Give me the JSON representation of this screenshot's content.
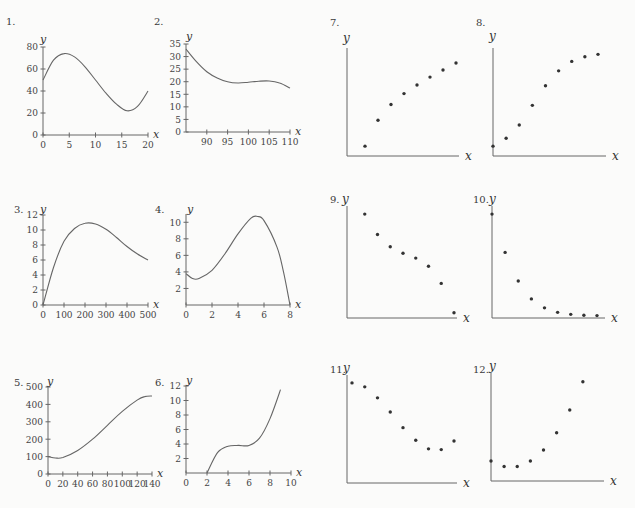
{
  "chart_data": [
    {
      "id": 1,
      "label": "1.",
      "type": "line",
      "xlabel": "x",
      "ylabel": "y",
      "xlim": [
        0,
        20
      ],
      "ylim": [
        0,
        80
      ],
      "xticks": [
        0,
        5,
        10,
        15,
        20
      ],
      "yticks": [
        0,
        20,
        40,
        60,
        80
      ],
      "x": [
        0,
        2,
        4,
        6,
        8,
        10,
        12,
        14,
        16,
        18,
        20
      ],
      "y": [
        50,
        68,
        74,
        71,
        62,
        50,
        38,
        28,
        22,
        26,
        40
      ]
    },
    {
      "id": 2,
      "label": "2.",
      "type": "line",
      "xlabel": "x",
      "ylabel": "y",
      "xlim": [
        85,
        110
      ],
      "ylim": [
        0,
        35
      ],
      "xticks": [
        90,
        95,
        100,
        105,
        110
      ],
      "yticks": [
        0,
        5,
        10,
        15,
        20,
        25,
        30,
        35
      ],
      "x": [
        85,
        87.5,
        90,
        92.5,
        95,
        97.5,
        100,
        102.5,
        105,
        107.5,
        110
      ],
      "y": [
        33,
        28,
        24,
        21.5,
        20,
        19.5,
        19.8,
        20.2,
        20.3,
        19.5,
        17.5
      ]
    },
    {
      "id": 3,
      "label": "3.",
      "type": "line",
      "xlabel": "x",
      "ylabel": "y",
      "xlim": [
        0,
        500
      ],
      "ylim": [
        0,
        12
      ],
      "xticks": [
        0,
        100,
        200,
        300,
        400,
        500
      ],
      "yticks": [
        0,
        2,
        4,
        6,
        8,
        10,
        12
      ],
      "x": [
        0,
        50,
        100,
        150,
        200,
        250,
        300,
        350,
        400,
        450,
        500
      ],
      "y": [
        0,
        5,
        8.5,
        10.2,
        10.9,
        10.8,
        10.1,
        9,
        7.8,
        6.8,
        6
      ]
    },
    {
      "id": 4,
      "label": "4.",
      "type": "line",
      "xlabel": "x",
      "ylabel": "y",
      "xlim": [
        0,
        8
      ],
      "ylim": [
        0,
        11
      ],
      "xticks": [
        0,
        2,
        4,
        6,
        8
      ],
      "yticks": [
        2,
        4,
        6,
        8,
        10
      ],
      "x": [
        0,
        0.5,
        1,
        2,
        3,
        4,
        5,
        5.5,
        6,
        7,
        7.5,
        8
      ],
      "y": [
        3.8,
        3.2,
        3.2,
        4.2,
        6.2,
        8.6,
        10.5,
        10.7,
        10.2,
        7,
        4,
        0
      ]
    },
    {
      "id": 5,
      "label": "5.",
      "type": "line",
      "xlabel": "x",
      "ylabel": "y",
      "xlim": [
        0,
        140
      ],
      "ylim": [
        0,
        500
      ],
      "xticks": [
        0,
        20,
        40,
        60,
        80,
        100,
        120,
        140
      ],
      "yticks": [
        0,
        100,
        200,
        300,
        400,
        500
      ],
      "x": [
        0,
        10,
        20,
        40,
        60,
        80,
        100,
        120,
        130,
        140
      ],
      "y": [
        100,
        92,
        95,
        135,
        200,
        280,
        360,
        425,
        445,
        448
      ]
    },
    {
      "id": 6,
      "label": "6.",
      "type": "line",
      "xlabel": "x",
      "ylabel": "y",
      "xlim": [
        0,
        10
      ],
      "ylim": [
        0,
        12
      ],
      "xticks": [
        0,
        2,
        4,
        6,
        8,
        10
      ],
      "yticks": [
        2,
        4,
        6,
        8,
        10,
        12
      ],
      "x": [
        2,
        3,
        4,
        5,
        6,
        7,
        8,
        9
      ],
      "y": [
        0,
        2.8,
        3.7,
        3.8,
        3.8,
        4.8,
        7.5,
        11.5
      ]
    },
    {
      "id": 7,
      "label": "7.",
      "type": "scatter",
      "xlabel": "x",
      "ylabel": "y",
      "points": [
        [
          1,
          1.0
        ],
        [
          2,
          4.3
        ],
        [
          3,
          6.3
        ],
        [
          4,
          7.7
        ],
        [
          5,
          8.8
        ],
        [
          6,
          9.8
        ],
        [
          7,
          10.7
        ],
        [
          8,
          11.6
        ]
      ]
    },
    {
      "id": 8,
      "label": "8.",
      "type": "scatter",
      "xlabel": "x",
      "ylabel": "y",
      "points": [
        [
          0,
          1.0
        ],
        [
          1,
          2.0
        ],
        [
          2,
          3.7
        ],
        [
          3,
          6.2
        ],
        [
          4,
          8.7
        ],
        [
          5,
          10.6
        ],
        [
          6,
          11.8
        ],
        [
          7,
          12.4
        ],
        [
          8,
          12.7
        ]
      ]
    },
    {
      "id": 9,
      "label": "9.",
      "type": "scatter",
      "xlabel": "x",
      "ylabel": "y",
      "points": [
        [
          1,
          12.5
        ],
        [
          2,
          10.0
        ],
        [
          3,
          8.5
        ],
        [
          4,
          7.7
        ],
        [
          5,
          7.1
        ],
        [
          6,
          6.1
        ],
        [
          7,
          4.0
        ],
        [
          8,
          0.4
        ]
      ]
    },
    {
      "id": 10,
      "label": "10.",
      "type": "scatter",
      "xlabel": "x",
      "ylabel": "y",
      "points": [
        [
          0,
          12.5
        ],
        [
          1,
          7.8
        ],
        [
          2,
          4.3
        ],
        [
          3,
          2.1
        ],
        [
          4,
          1.0
        ],
        [
          5,
          0.45
        ],
        [
          6,
          0.2
        ],
        [
          7,
          0.1
        ],
        [
          8,
          0.05
        ]
      ]
    },
    {
      "id": 11,
      "label": "11.",
      "type": "scatter",
      "xlabel": "x",
      "ylabel": "y",
      "points": [
        [
          0,
          12.5
        ],
        [
          1,
          12.0
        ],
        [
          2,
          10.6
        ],
        [
          3,
          8.8
        ],
        [
          4,
          6.8
        ],
        [
          5,
          5.2
        ],
        [
          6,
          4.1
        ],
        [
          7,
          4.0
        ],
        [
          8,
          5.1
        ]
      ]
    },
    {
      "id": 12,
      "label": "12.",
      "type": "scatter",
      "xlabel": "x",
      "ylabel": "y",
      "points": [
        [
          0,
          2.3
        ],
        [
          1,
          1.6
        ],
        [
          2,
          1.6
        ],
        [
          3,
          2.3
        ],
        [
          4,
          3.7
        ],
        [
          5,
          5.9
        ],
        [
          6,
          8.8
        ],
        [
          7,
          12.4
        ]
      ]
    }
  ]
}
